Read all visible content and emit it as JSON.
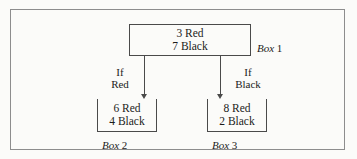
{
  "figure": {
    "type": "probability-tree-diagram",
    "background_color": "#fbfbf9",
    "line_color": "#4a4a4a",
    "frame_color": "#8d8d8d"
  },
  "root_box": {
    "name": "Box 1",
    "label_word": "Box",
    "label_number": "1",
    "red_line": "3 Red",
    "black_line": "7 Black",
    "red_count": 3,
    "black_count": 7
  },
  "branches": [
    {
      "id": "left",
      "condition_line1": "If",
      "condition_line2": "Red",
      "arrow": "down-arrow-icon"
    },
    {
      "id": "right",
      "condition_line1": "If",
      "condition_line2": "Black",
      "arrow": "down-arrow-icon"
    }
  ],
  "leaf_boxes": [
    {
      "name": "Box 2",
      "label_word": "Box",
      "label_number": "2",
      "red_line": "6 Red",
      "black_line": "4 Black",
      "red_count": 6,
      "black_count": 4
    },
    {
      "name": "Box 3",
      "label_word": "Box",
      "label_number": "3",
      "red_line": "8 Red",
      "black_line": "2 Black",
      "red_count": 8,
      "black_count": 2
    }
  ]
}
